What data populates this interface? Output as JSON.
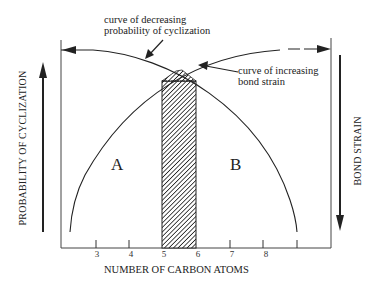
{
  "diagram": {
    "annotations": {
      "decreasing_curve_line1": "curve of decreasing",
      "decreasing_curve_line2": "probability of cyclization",
      "increasing_curve_line1": "curve of increasing",
      "increasing_curve_line2": "bond strain"
    },
    "regions": {
      "a": "A",
      "b": "B"
    },
    "axes": {
      "x_label": "NUMBER OF CARBON ATOMS",
      "left_label": "PROBABILITY OF CYCLIZATION",
      "right_label": "BOND STRAIN"
    },
    "ticks": [
      "3",
      "4",
      "5",
      "6",
      "7",
      "8",
      ""
    ],
    "highlight": {
      "from": "5",
      "to": "6",
      "pattern": "diagonal-hatch"
    },
    "colors": {
      "ink": "#222222",
      "frame": "#555555",
      "background": "#ffffff"
    }
  }
}
